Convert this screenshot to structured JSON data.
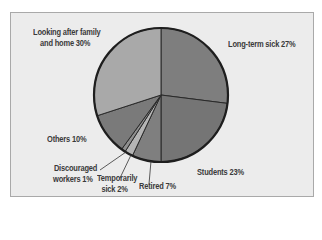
{
  "chart_data": {
    "type": "pie",
    "title": "",
    "start_angle_deg": 0,
    "direction": "clockwise",
    "slices": [
      {
        "label": "Long-term sick",
        "value": 27,
        "color": "#7e7e7e"
      },
      {
        "label": "Students",
        "value": 23,
        "color": "#757575"
      },
      {
        "label": "Retired",
        "value": 7,
        "color": "#7f7f7f"
      },
      {
        "label": "Temporarily sick",
        "value": 2,
        "color": "#b5b5b5"
      },
      {
        "label": "Discouraged workers",
        "value": 1,
        "color": "#8f8f8f"
      },
      {
        "label": "Others",
        "value": 10,
        "color": "#7a7a7a"
      },
      {
        "label": "Looking after family and home",
        "value": 30,
        "color": "#a9a9a9"
      }
    ],
    "legend": "none (direct labels)"
  },
  "labels": {
    "family_line1": "Looking after family",
    "family_line2": "and home 30%",
    "longterm": "Long-term sick 27%",
    "students": "Students 23%",
    "retired": "Retired 7%",
    "temp_line1": "Temporarily",
    "temp_line2": "sick 2%",
    "disc_line1": "Discouraged",
    "disc_line2": "workers 1%",
    "others": "Others 10%"
  }
}
